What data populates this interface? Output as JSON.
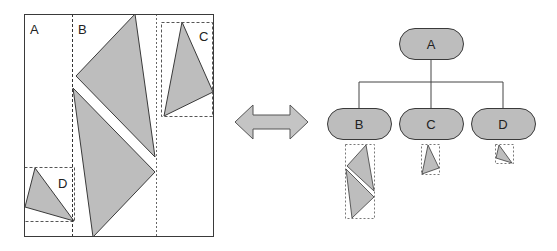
{
  "colors": {
    "fill": "#bdbdbd",
    "stroke": "#3a3a3a",
    "dash": "#555555",
    "background": "#ffffff"
  },
  "layout_panel": {
    "regions": [
      {
        "label": "A"
      },
      {
        "label": "B"
      },
      {
        "label": "C"
      },
      {
        "label": "D"
      }
    ]
  },
  "arrow": {
    "icon": "double-arrow-icon"
  },
  "tree": {
    "root": {
      "label": "A"
    },
    "children": [
      {
        "label": "B"
      },
      {
        "label": "C"
      },
      {
        "label": "D"
      }
    ]
  }
}
